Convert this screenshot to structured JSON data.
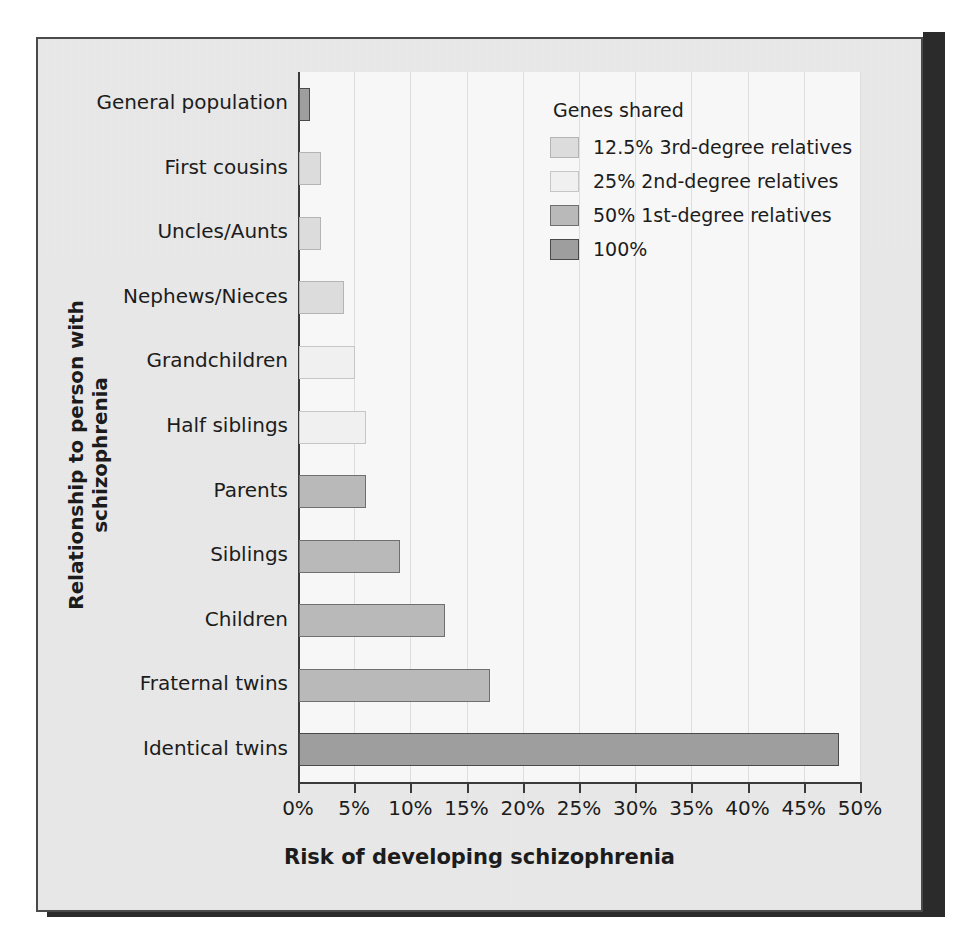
{
  "chart_data": {
    "type": "bar",
    "orientation": "horizontal",
    "title": "",
    "xlabel": "Risk of developing schizophrenia",
    "ylabel": "Relationship to person with schizophrenia",
    "xlim": [
      0,
      50
    ],
    "xtick_labels": [
      "0%",
      "5%",
      "10%",
      "15%",
      "20%",
      "25%",
      "30%",
      "35%",
      "40%",
      "45%",
      "50%"
    ],
    "xticks": [
      0,
      5,
      10,
      15,
      20,
      25,
      30,
      35,
      40,
      45,
      50
    ],
    "grid": "vertical",
    "legend_position": "top-right",
    "categories": [
      "General population",
      "First cousins",
      "Uncles/Aunts",
      "Nephews/Nieces",
      "Grandchildren",
      "Half siblings",
      "Parents",
      "Siblings",
      "Children",
      "Fraternal twins",
      "Identical twins"
    ],
    "values": [
      1,
      2,
      2,
      4,
      5,
      6,
      6,
      9,
      13,
      17,
      48
    ],
    "group_of_category": [
      "100%",
      "12.5% 3rd-degree relatives",
      "12.5% 3rd-degree relatives",
      "25% 2nd-degree relatives",
      "25% 2nd-degree relatives",
      "25% 2nd-degree relatives",
      "50% 1st-degree relatives",
      "50% 1st-degree relatives",
      "50% 1st-degree relatives",
      "50% 1st-degree relatives",
      "100%"
    ],
    "bars": [
      {
        "category": "General population",
        "value": 1,
        "level": "lvl-100"
      },
      {
        "category": "First cousins",
        "value": 2,
        "level": "lvl-125"
      },
      {
        "category": "Uncles/Aunts",
        "value": 2,
        "level": "lvl-125"
      },
      {
        "category": "Nephews/Nieces",
        "value": 4,
        "level": "lvl-125"
      },
      {
        "category": "Grandchildren",
        "value": 5,
        "level": "lvl-25"
      },
      {
        "category": "Half siblings",
        "value": 6,
        "level": "lvl-25"
      },
      {
        "category": "Parents",
        "value": 6,
        "level": "lvl-50"
      },
      {
        "category": "Siblings",
        "value": 9,
        "level": "lvl-50"
      },
      {
        "category": "Children",
        "value": 13,
        "level": "lvl-50"
      },
      {
        "category": "Fraternal twins",
        "value": 17,
        "level": "lvl-50"
      },
      {
        "category": "Identical twins",
        "value": 48,
        "level": "lvl-100"
      }
    ],
    "legend": {
      "title": "Genes shared",
      "entries": [
        {
          "label": "12.5% 3rd-degree relatives",
          "level": "lvl-125"
        },
        {
          "label": "25% 2nd-degree relatives",
          "level": "lvl-25"
        },
        {
          "label": "50% 1st-degree relatives",
          "level": "lvl-50"
        },
        {
          "label": "100%",
          "level": "lvl-100"
        }
      ]
    },
    "colors": {
      "level_12_5": "#dcdcdc",
      "level_25": "#f0f0f0",
      "level_50": "#b9b9b9",
      "level_100": "#9e9e9e",
      "plot_background": "#f7f7f7",
      "figure_background": "#e9e9e9",
      "frame_border": "#4a4a4a",
      "gridline": "#dedede",
      "text": "#1c1c1c"
    }
  }
}
